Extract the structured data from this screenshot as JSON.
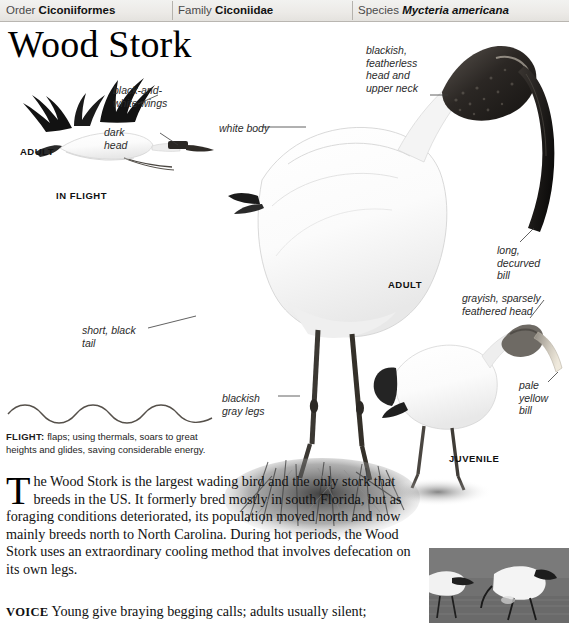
{
  "taxonomy": {
    "order_label": "Order",
    "order_value": "Ciconiiformes",
    "family_label": "Family",
    "family_value": "Ciconiidae",
    "species_label": "Species",
    "species_value": "Mycteria americana"
  },
  "title": "Wood Stork",
  "annotations": {
    "wings": "black-and-\nwhite wings",
    "dark_head": "dark\nhead",
    "white_body": "white body",
    "blackish_head": "blackish,\nfeatherless\nhead and\nupper neck",
    "long_bill": "long,\ndecurved\nbill",
    "short_tail": "short, black\ntail",
    "legs": "blackish\ngray legs",
    "juv_head": "grayish, sparsely\nfeathered head",
    "juv_bill": "pale\nyellow\nbill"
  },
  "captions": {
    "adult_flight": "ADULT",
    "in_flight": "IN FLIGHT",
    "adult_main": "ADULT",
    "juvenile": "JUVENILE"
  },
  "flight": {
    "label": "FLIGHT:",
    "text": " flaps; using thermals, soars to great heights and glides, saving considerable energy."
  },
  "body": {
    "dropcap": "T",
    "paragraph_start": "he Wood Stork is the largest wading bird and the only stork",
    "paragraph": "that breeds in the US. It formerly bred mostly in south Florida, but as foraging conditions deteriorated, its population moved north and now mainly breeds north to North Carolina. During hot periods, the Wood Stork uses an extraordinary cooling method that involves defecation on its own legs."
  },
  "voice": {
    "label": "VOICE",
    "text": " Young give braying begging calls; adults usually silent;"
  },
  "colors": {
    "header_bg": "#ecebe8",
    "text": "#111111",
    "rule": "#b5b2ad"
  }
}
